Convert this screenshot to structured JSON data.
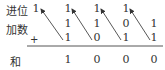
{
  "labels": {
    "carry": "进位",
    "addend": "加数",
    "plus": "+",
    "sum": "和"
  },
  "carry_row": [
    "1",
    "1",
    "1",
    "1"
  ],
  "addend_row1": [
    "1",
    "1",
    "0",
    "1"
  ],
  "addend_row2": [
    "1",
    "0",
    "1",
    "1"
  ],
  "sum_row": [
    "1",
    "0",
    "0",
    "0"
  ]
}
